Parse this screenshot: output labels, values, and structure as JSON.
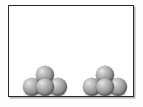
{
  "scene": {
    "title": "Two clusters of spheres in a rectangular box",
    "background_color": "#ffffff",
    "outer_background_color": "#fdfdfd"
  },
  "frame": {
    "name": "container-box",
    "border_color": "#2b2b2b",
    "border_width_px": 1.5,
    "fill_color": "#ffffff",
    "left_px": 8,
    "top_px": 5,
    "width_px": 126,
    "height_px": 92,
    "shadow_color": "#787878"
  },
  "clusters": [
    {
      "id": "cluster-left",
      "label": "Left sphere cluster",
      "sphere_count": 4,
      "arrangement": "pyramid: 3 bottom, 1 top",
      "position": "bottom-left of box",
      "spheres": [
        {
          "id": "left-bottom-left",
          "row": "bottom",
          "slot": "left"
        },
        {
          "id": "left-bottom-center",
          "row": "bottom",
          "slot": "center"
        },
        {
          "id": "left-bottom-right",
          "row": "bottom",
          "slot": "right"
        },
        {
          "id": "left-apex",
          "row": "top",
          "slot": "apex"
        }
      ]
    },
    {
      "id": "cluster-right",
      "label": "Right sphere cluster",
      "sphere_count": 4,
      "arrangement": "pyramid: 3 bottom, 1 top",
      "position": "bottom-right of box",
      "spheres": [
        {
          "id": "right-bottom-left",
          "row": "bottom",
          "slot": "left"
        },
        {
          "id": "right-bottom-center",
          "row": "bottom",
          "slot": "center"
        },
        {
          "id": "right-bottom-right",
          "row": "bottom",
          "slot": "right"
        },
        {
          "id": "right-apex",
          "row": "top",
          "slot": "apex"
        }
      ]
    }
  ],
  "sphere_style": {
    "diameter_px": 18,
    "highlight_color": "#e8e8e8",
    "midtone_color": "#949494",
    "shade_color": "#585858",
    "outline_color": "#464646"
  }
}
